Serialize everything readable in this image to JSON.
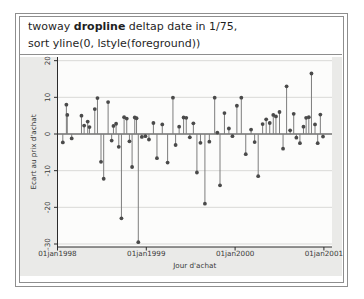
{
  "header": {
    "line1_pre": "twoway ",
    "line1_bold": "dropline",
    "line1_post": " deltap date in 1/75,",
    "line2": "sort yline(0, lstyle(foreground))"
  },
  "chart_data": {
    "type": "scatter",
    "style": "dropline-stems-to-baseline",
    "title": "",
    "xlabel": "Jour d'achat",
    "ylabel": "Ecart au prix d'achat",
    "baseline": 0,
    "grid": "horizontal-light",
    "legend": "none",
    "xlim_years_since_1998": [
      0,
      3.09
    ],
    "ylim": [
      -31,
      21
    ],
    "x_ticks": [
      {
        "t": 0,
        "label": "01jan1998"
      },
      {
        "t": 1,
        "label": "01jan1999"
      },
      {
        "t": 2,
        "label": "01jan2000"
      },
      {
        "t": 3,
        "label": "01jan2001"
      }
    ],
    "y_ticks": [
      20,
      10,
      0,
      -10,
      -20,
      -30
    ],
    "points_t_value": [
      [
        0.06,
        -2.3
      ],
      [
        0.1,
        8.0
      ],
      [
        0.11,
        5.2
      ],
      [
        0.16,
        -1.2
      ],
      [
        0.27,
        5.0
      ],
      [
        0.3,
        2.3
      ],
      [
        0.34,
        3.4
      ],
      [
        0.36,
        1.9
      ],
      [
        0.42,
        6.8
      ],
      [
        0.45,
        9.8
      ],
      [
        0.49,
        -7.6
      ],
      [
        0.52,
        -12.2
      ],
      [
        0.57,
        8.7
      ],
      [
        0.61,
        -1.8
      ],
      [
        0.63,
        2.2
      ],
      [
        0.66,
        2.8
      ],
      [
        0.69,
        -3.5
      ],
      [
        0.72,
        -23.0
      ],
      [
        0.75,
        4.6
      ],
      [
        0.78,
        4.2
      ],
      [
        0.81,
        -2.0
      ],
      [
        0.84,
        -9.0
      ],
      [
        0.87,
        4.5
      ],
      [
        0.89,
        4.3
      ],
      [
        0.91,
        -29.5
      ],
      [
        0.95,
        -0.8
      ],
      [
        0.99,
        -0.6
      ],
      [
        1.03,
        -1.5
      ],
      [
        1.08,
        3.0
      ],
      [
        1.12,
        -6.6
      ],
      [
        1.18,
        2.6
      ],
      [
        1.24,
        -7.8
      ],
      [
        1.3,
        9.9
      ],
      [
        1.33,
        -3.0
      ],
      [
        1.37,
        2.0
      ],
      [
        1.42,
        4.5
      ],
      [
        1.45,
        4.4
      ],
      [
        1.49,
        -0.9
      ],
      [
        1.53,
        2.9
      ],
      [
        1.57,
        -10.5
      ],
      [
        1.61,
        -2.4
      ],
      [
        1.66,
        -19.0
      ],
      [
        1.71,
        -2.1
      ],
      [
        1.77,
        9.9
      ],
      [
        1.8,
        0.4
      ],
      [
        1.83,
        -14.0
      ],
      [
        1.88,
        5.7
      ],
      [
        1.93,
        1.5
      ],
      [
        1.97,
        -0.6
      ],
      [
        2.02,
        7.7
      ],
      [
        2.07,
        9.9
      ],
      [
        2.12,
        -5.5
      ],
      [
        2.18,
        1.2
      ],
      [
        2.22,
        -2.2
      ],
      [
        2.26,
        -11.5
      ],
      [
        2.31,
        2.7
      ],
      [
        2.35,
        4.0
      ],
      [
        2.39,
        3.0
      ],
      [
        2.43,
        5.2
      ],
      [
        2.46,
        4.8
      ],
      [
        2.5,
        6.0
      ],
      [
        2.54,
        -4.0
      ],
      [
        2.58,
        13.0
      ],
      [
        2.62,
        1.0
      ],
      [
        2.66,
        5.5
      ],
      [
        2.69,
        -1.0
      ],
      [
        2.73,
        -2.5
      ],
      [
        2.77,
        2.0
      ],
      [
        2.8,
        4.4
      ],
      [
        2.83,
        4.6
      ],
      [
        2.86,
        16.5
      ],
      [
        2.9,
        2.6
      ],
      [
        2.93,
        -2.5
      ],
      [
        2.96,
        5.3
      ],
      [
        2.99,
        -0.7
      ]
    ]
  },
  "colors": {
    "frame": "#8e8e8e",
    "graph_bg": "#eaeae8",
    "plot_bg": "#fcfcfb",
    "grid": "#d9d9d7",
    "axis": "#2b2b2b",
    "zero_line": "#2b2b2b",
    "stem": "#7d7d7d",
    "marker": "#4a4a4a",
    "tick_text": "#3a3a3a",
    "header_text": "#1f1f1f"
  }
}
